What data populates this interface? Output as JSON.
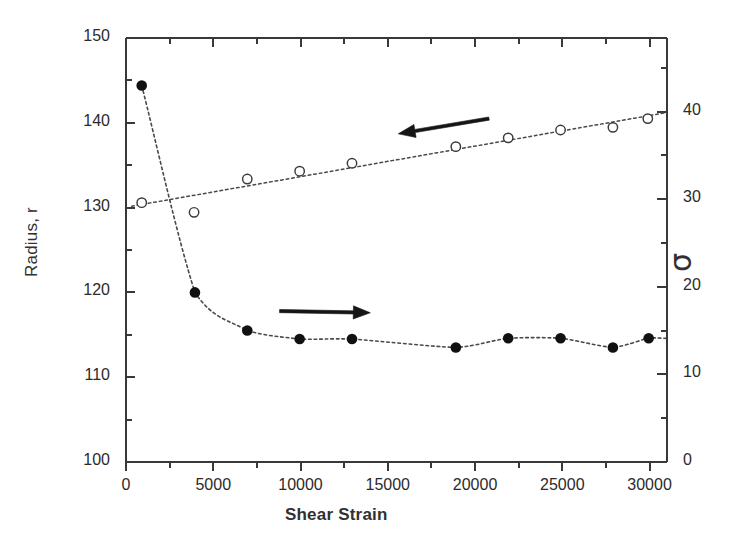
{
  "chart_data": {
    "type": "scatter",
    "title": "",
    "xlabel": "Shear Strain",
    "ylabel_left": "Radius, r",
    "ylabel_right": "σ",
    "xlim": [
      0,
      31000
    ],
    "ylim_left": [
      100,
      150
    ],
    "ylim_right": [
      0,
      48.4
    ],
    "grid": false,
    "legend": "none",
    "x_ticks": [
      {
        "value": 0,
        "label": "0"
      },
      {
        "value": 5000,
        "label": "5000"
      },
      {
        "value": 10000,
        "label": "10000"
      },
      {
        "value": 15000,
        "label": "15000"
      },
      {
        "value": 20000,
        "label": "20000"
      },
      {
        "value": 25000,
        "label": "25000"
      },
      {
        "value": 30000,
        "label": "30000"
      }
    ],
    "x_minor_ticks": [
      2500,
      7500,
      12500,
      17500,
      22500,
      27500
    ],
    "y_ticks_left": [
      {
        "value": 150,
        "label": "150"
      },
      {
        "value": 140,
        "label": "140"
      },
      {
        "value": 130,
        "label": "130"
      },
      {
        "value": 120,
        "label": "120"
      },
      {
        "value": 110,
        "label": "110"
      },
      {
        "value": 100,
        "label": "100"
      }
    ],
    "y_minor_ticks_left": [
      145,
      135,
      125,
      115,
      105
    ],
    "y_ticks_right": [
      {
        "value": 40,
        "label": "40"
      },
      {
        "value": 30,
        "label": "30"
      },
      {
        "value": 20,
        "label": "20"
      },
      {
        "value": 10,
        "label": "10"
      },
      {
        "value": 0,
        "label": "0"
      }
    ],
    "y_minor_ticks_right": [
      45,
      35,
      25,
      15,
      5
    ],
    "series": [
      {
        "name": "Radius, r",
        "axis": "left",
        "marker": "filled-circle",
        "marker_color": "#111111",
        "line_style": "dotted",
        "points": [
          {
            "x": 900,
            "y": 144.4
          },
          {
            "x": 3950,
            "y": 120.0
          },
          {
            "x": 6950,
            "y": 115.5
          },
          {
            "x": 9950,
            "y": 114.5
          },
          {
            "x": 12950,
            "y": 114.5
          },
          {
            "x": 18900,
            "y": 113.5
          },
          {
            "x": 21900,
            "y": 114.6
          },
          {
            "x": 24900,
            "y": 114.6
          },
          {
            "x": 27900,
            "y": 113.5
          },
          {
            "x": 29950,
            "y": 114.6
          }
        ]
      },
      {
        "name": "σ",
        "axis": "right",
        "marker": "open-circle",
        "marker_color": "#3a3a3a",
        "line_style": "dotted",
        "points": [
          {
            "x": 900,
            "y": 29.6
          },
          {
            "x": 3900,
            "y": 28.5
          },
          {
            "x": 6950,
            "y": 32.3
          },
          {
            "x": 9950,
            "y": 33.2
          },
          {
            "x": 12950,
            "y": 34.1
          },
          {
            "x": 18900,
            "y": 36.0
          },
          {
            "x": 21900,
            "y": 37.0
          },
          {
            "x": 24900,
            "y": 37.9
          },
          {
            "x": 27900,
            "y": 38.2
          },
          {
            "x": 29900,
            "y": 39.2
          }
        ]
      }
    ],
    "annotations": [
      {
        "name": "arrow-to-right-axis",
        "type": "arrow",
        "direction": "left",
        "from_x": 20800,
        "from_y_left": 140.5,
        "to_x": 15600,
        "to_y_left": 138.7
      },
      {
        "name": "arrow-to-left-axis",
        "type": "arrow",
        "direction": "right",
        "from_x": 8800,
        "from_y_left": 117.8,
        "to_x": 14000,
        "to_y_left": 117.6
      }
    ]
  }
}
